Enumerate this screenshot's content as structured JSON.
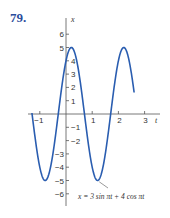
{
  "problem_number": "79.",
  "chart_data": {
    "type": "line",
    "title": "",
    "xlabel": "t",
    "ylabel": "x",
    "xlim": [
      -1.4,
      3.2
    ],
    "ylim": [
      -6.5,
      6.5
    ],
    "x_ticks": [
      -1,
      1,
      2,
      3
    ],
    "y_ticks": [
      -6,
      -5,
      -4,
      -3,
      -2,
      -1,
      1,
      2,
      3,
      4,
      5,
      6
    ],
    "grid": false,
    "annotation": "x = 3 sin πt + 4 cos πt",
    "function": "3*sin(pi*t) + 4*cos(pi*t)",
    "domain": [
      -1.3,
      2.6
    ],
    "series": [
      {
        "name": "x = 3 sin πt + 4 cos πt",
        "color": "#2a5db0",
        "x": [
          -1.3,
          -1.0,
          -0.795,
          -0.5,
          -0.205,
          0.0,
          0.205,
          0.5,
          0.705,
          1.0,
          1.205,
          1.5,
          1.705,
          2.0,
          2.205,
          2.5,
          2.6
        ],
        "values": [
          1.67,
          -4.0,
          -5.0,
          -3.0,
          3.0,
          4.0,
          5.0,
          3.0,
          0.0,
          -4.0,
          -5.0,
          -3.0,
          0.0,
          4.0,
          5.0,
          3.0,
          1.67
        ]
      }
    ]
  }
}
